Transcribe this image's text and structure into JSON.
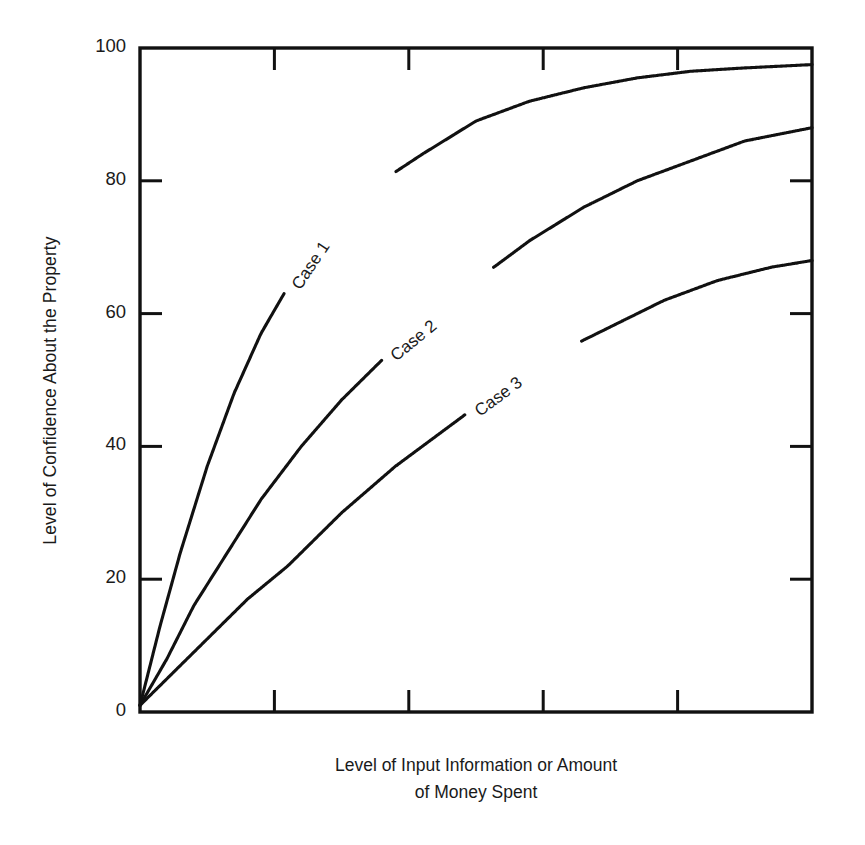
{
  "chart_data": {
    "type": "line",
    "title": "",
    "subtitle": "",
    "xlabel_line1": "Level of Input Information or Amount",
    "xlabel_line2": "of Money Spent",
    "ylabel": "Level of Confidence About the Property",
    "xlim": [
      0,
      100
    ],
    "ylim": [
      0,
      100
    ],
    "grid": false,
    "legend_position": "inline-along-curves",
    "x_tick_labels": [
      "",
      "",
      "",
      "",
      "",
      ""
    ],
    "x_ticks": [
      0,
      20,
      40,
      60,
      80,
      100
    ],
    "y_ticks": [
      0,
      20,
      40,
      60,
      80,
      100
    ],
    "y_tick_labels": [
      "0",
      "20",
      "40",
      "60",
      "80",
      "100"
    ],
    "axis_ticks_direction": "inward",
    "axes_framed": true,
    "series": [
      {
        "name": "Case 1",
        "label": "Case 1",
        "x": [
          0,
          3,
          6,
          10,
          14,
          18,
          22,
          26,
          30,
          36,
          42,
          50,
          58,
          66,
          74,
          82,
          90,
          100
        ],
        "values": [
          1,
          13,
          24,
          37,
          48,
          57,
          64,
          70,
          74,
          80,
          84,
          89,
          92,
          94,
          95.5,
          96.5,
          97,
          97.5
        ]
      },
      {
        "name": "Case 2",
        "label": "Case 2",
        "x": [
          0,
          4,
          8,
          13,
          18,
          24,
          30,
          36,
          42,
          50,
          58,
          66,
          74,
          82,
          90,
          100
        ],
        "values": [
          1,
          8,
          16,
          24,
          32,
          40,
          47,
          53,
          58,
          65,
          71,
          76,
          80,
          83,
          86,
          88
        ]
      },
      {
        "name": "Case 3",
        "label": "Case 3",
        "x": [
          0,
          5,
          10,
          16,
          22,
          30,
          38,
          46,
          54,
          62,
          70,
          78,
          86,
          94,
          100
        ],
        "values": [
          1,
          6,
          11,
          17,
          22,
          30,
          37,
          43,
          49,
          54,
          58,
          62,
          65,
          67,
          68
        ]
      }
    ],
    "colors": {
      "line": "#111111",
      "background": "#ffffff",
      "text": "#1a1a1a"
    }
  },
  "axis": {
    "y_title": "Level of Confidence About the Property",
    "x_title_line1": "Level of Input Information or Amount",
    "x_title_line2": "of Money Spent",
    "y_labels": [
      "100",
      "80",
      "60",
      "40",
      "20",
      "0"
    ]
  },
  "series_labels": {
    "case1": "Case 1",
    "case2": "Case 2",
    "case3": "Case 3"
  }
}
